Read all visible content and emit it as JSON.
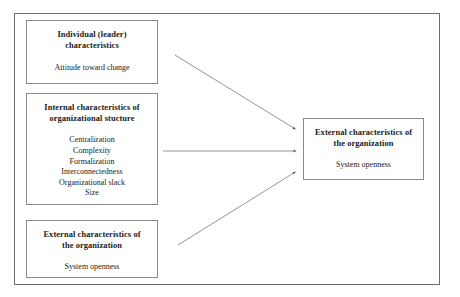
{
  "diagram": {
    "frame": {
      "label": "diagram-border"
    },
    "nodes": [
      {
        "id": "individual",
        "title": "Individual (leader)\ncharacteristics",
        "items": "Attitude toward change"
      },
      {
        "id": "internal",
        "title": "Internal characteristics of\norganizational stucture",
        "items": "Centralization\nComplexity\nFormalization\nInterconnectedness\nOrganizational slack\nSize"
      },
      {
        "id": "external_left",
        "title": "External characteristics of\nthe organization",
        "items": "System openness"
      },
      {
        "id": "external_right",
        "title": "External characteristics of\nthe organization",
        "items": "System openness"
      }
    ],
    "arrows": [
      {
        "id": "arrow-individual-to-external",
        "from": "individual",
        "to": "external_right",
        "direction": "down-right"
      },
      {
        "id": "arrow-internal-to-external",
        "from": "internal",
        "to": "external_right",
        "direction": "right"
      },
      {
        "id": "arrow-external-left-to-external-right",
        "from": "external_left",
        "to": "external_right",
        "direction": "up-right"
      }
    ],
    "colors": {
      "frame_border": "#6e6e6e",
      "box_border": "#8a8a8a",
      "arrow": "#7a7a82",
      "text": "#1a1a1a",
      "background": "#ffffff"
    }
  }
}
